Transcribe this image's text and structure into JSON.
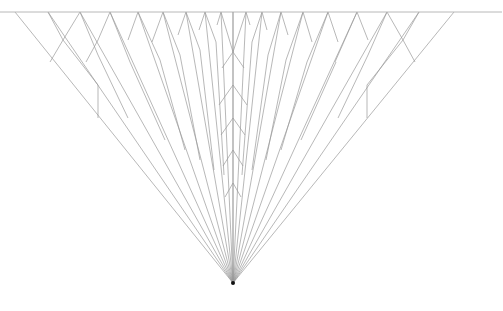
{
  "diagram": {
    "type": "ray-fan-reflection",
    "canvas": {
      "width": 503,
      "height": 311,
      "background": "#ffffff"
    },
    "colors": {
      "line": "#9a9a9a",
      "mirror": "#b8b8b8",
      "apex": "#111111"
    },
    "mirror_line": {
      "x1": 0,
      "y1": 12,
      "x2": 502,
      "y2": 12
    },
    "apex": {
      "x": 233,
      "y": 283
    },
    "top_points_x": [
      15,
      48,
      80,
      110,
      138,
      163,
      186,
      205,
      221,
      233,
      246,
      262,
      281,
      303,
      328,
      357,
      387,
      419,
      454
    ],
    "vertical_center_line": {
      "x": 233,
      "y1": 12,
      "y2": 283
    },
    "reflected_segments": [
      [
        48,
        12,
        63,
        40
      ],
      [
        80,
        12,
        63,
        40
      ],
      [
        63,
        40,
        50,
        62
      ],
      [
        80,
        12,
        98,
        55
      ],
      [
        110,
        12,
        98,
        40
      ],
      [
        98,
        40,
        86,
        62
      ],
      [
        110,
        12,
        130,
        62
      ],
      [
        138,
        12,
        128,
        40
      ],
      [
        138,
        12,
        160,
        60
      ],
      [
        163,
        12,
        152,
        42
      ],
      [
        163,
        12,
        180,
        55
      ],
      [
        186,
        12,
        178,
        35
      ],
      [
        186,
        12,
        200,
        50
      ],
      [
        205,
        12,
        199,
        30
      ],
      [
        205,
        12,
        216,
        42
      ],
      [
        221,
        12,
        217,
        25
      ],
      [
        221,
        12,
        233,
        52
      ],
      [
        246,
        12,
        233,
        52
      ],
      [
        262,
        12,
        252,
        42
      ],
      [
        246,
        12,
        250,
        25
      ],
      [
        281,
        12,
        268,
        55
      ],
      [
        262,
        12,
        267,
        30
      ],
      [
        303,
        12,
        286,
        60
      ],
      [
        281,
        12,
        288,
        35
      ],
      [
        328,
        12,
        307,
        62
      ],
      [
        303,
        12,
        312,
        42
      ],
      [
        357,
        12,
        335,
        62
      ],
      [
        328,
        12,
        338,
        42
      ],
      [
        387,
        12,
        368,
        55
      ],
      [
        357,
        12,
        368,
        40
      ],
      [
        387,
        12,
        403,
        40
      ],
      [
        419,
        12,
        403,
        40
      ],
      [
        403,
        40,
        415,
        62
      ],
      [
        98,
        85,
        98,
        118
      ],
      [
        367,
        85,
        367,
        118
      ],
      [
        233,
        52,
        222,
        68
      ],
      [
        233,
        52,
        244,
        68
      ],
      [
        233,
        85,
        219,
        105
      ],
      [
        233,
        85,
        247,
        105
      ],
      [
        233,
        118,
        221,
        135
      ],
      [
        233,
        118,
        245,
        135
      ],
      [
        233,
        150,
        223,
        166
      ],
      [
        233,
        150,
        243,
        166
      ],
      [
        233,
        183,
        225,
        197
      ],
      [
        233,
        183,
        241,
        197
      ],
      [
        130,
        62,
        165,
        140
      ],
      [
        160,
        60,
        185,
        150
      ],
      [
        180,
        55,
        200,
        160
      ],
      [
        200,
        50,
        214,
        170
      ],
      [
        216,
        42,
        224,
        175
      ],
      [
        336,
        62,
        301,
        140
      ],
      [
        307,
        62,
        281,
        150
      ],
      [
        286,
        60,
        266,
        160
      ],
      [
        268,
        55,
        252,
        170
      ],
      [
        252,
        42,
        242,
        175
      ],
      [
        63,
        40,
        98,
        85
      ],
      [
        98,
        55,
        128,
        118
      ],
      [
        403,
        40,
        367,
        85
      ],
      [
        368,
        55,
        338,
        118
      ]
    ]
  }
}
